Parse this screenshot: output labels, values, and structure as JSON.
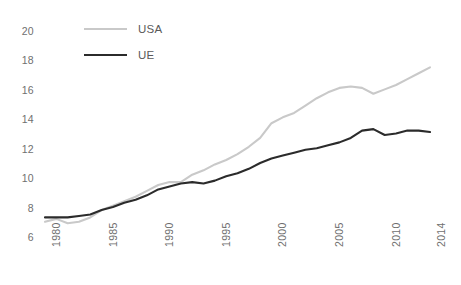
{
  "chart_data": {
    "type": "line",
    "title": "",
    "subtitle": "",
    "xlabel": "",
    "ylabel": "",
    "xlim": [
      1980,
      2014
    ],
    "ylim": [
      6,
      20
    ],
    "yticks": [
      6,
      8,
      10,
      12,
      14,
      16,
      18,
      20
    ],
    "xticks": [
      1980,
      1985,
      1990,
      1995,
      2000,
      2005,
      2010,
      2014
    ],
    "grid": false,
    "legend_position": "top-left",
    "x": [
      1980,
      1981,
      1982,
      1983,
      1984,
      1985,
      1986,
      1987,
      1988,
      1989,
      1990,
      1991,
      1992,
      1993,
      1994,
      1995,
      1996,
      1997,
      1998,
      1999,
      2000,
      2001,
      2002,
      2003,
      2004,
      2005,
      2006,
      2007,
      2008,
      2009,
      2010,
      2011,
      2012,
      2013,
      2014
    ],
    "series": [
      {
        "name": "USA",
        "color": "#c9c9c9",
        "values": [
          7.1,
          7.3,
          7.0,
          7.1,
          7.4,
          7.9,
          8.2,
          8.5,
          8.8,
          9.2,
          9.6,
          9.8,
          9.8,
          10.3,
          10.6,
          11.0,
          11.3,
          11.7,
          12.2,
          12.8,
          13.8,
          14.2,
          14.5,
          15.0,
          15.5,
          15.9,
          16.2,
          16.3,
          16.2,
          15.8,
          16.1,
          16.4,
          16.8,
          17.2,
          17.6
        ]
      },
      {
        "name": "UE",
        "color": "#2b2b2b",
        "values": [
          7.4,
          7.4,
          7.4,
          7.5,
          7.6,
          7.9,
          8.1,
          8.4,
          8.6,
          8.9,
          9.3,
          9.5,
          9.7,
          9.8,
          9.7,
          9.9,
          10.2,
          10.4,
          10.7,
          11.1,
          11.4,
          11.6,
          11.8,
          12.0,
          12.1,
          12.3,
          12.5,
          12.8,
          13.3,
          13.4,
          13.0,
          13.1,
          13.3,
          13.3,
          13.2
        ]
      }
    ]
  },
  "legend": {
    "items": [
      {
        "label": "USA",
        "color": "#c9c9c9"
      },
      {
        "label": "UE",
        "color": "#2b2b2b"
      }
    ]
  },
  "axes": {
    "y_labels": [
      "20",
      "18",
      "16",
      "14",
      "12",
      "10",
      "8",
      "6"
    ],
    "x_labels": [
      "1980",
      "1985",
      "1990",
      "1995",
      "2000",
      "2005",
      "2010",
      "2014"
    ]
  }
}
